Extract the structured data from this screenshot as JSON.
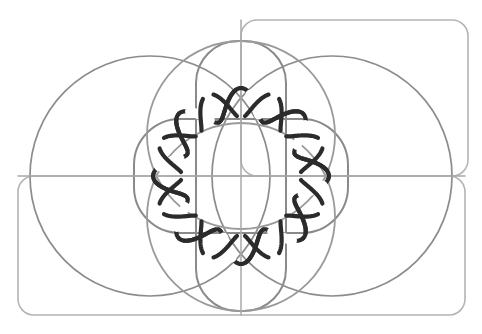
{
  "figure": {
    "canvas": {
      "width": 482,
      "height": 334,
      "background": "#ffffff"
    },
    "center": {
      "x": 241,
      "y": 176
    },
    "colors": {
      "rect_gray": "#b4b4b4",
      "circle_gray": "#8c8c8c",
      "lobe_gray": "#8a8a8a",
      "lens_gray": "#9a9a9a",
      "axis_gray": "#a8a8a8",
      "knot_dark": "#2b2b2b"
    },
    "stroke_widths": {
      "rect": 1.6,
      "circle": 1.7,
      "lobe": 2.0,
      "lens": 1.8,
      "axis": 1.5,
      "knot": 4.2
    },
    "layers": [
      {
        "name": "rounded-rect-top-right",
        "type": "rounded-rect",
        "x": 241,
        "y": 20,
        "width": 227,
        "height": 156,
        "radius": 16,
        "color_key": "rect_gray",
        "width_key": "rect"
      },
      {
        "name": "rounded-rect-bottom-left",
        "type": "rounded-rect",
        "x": 18,
        "y": 176,
        "width": 447,
        "height": 139,
        "radius": 16,
        "color_key": "rect_gray",
        "width_key": "rect"
      },
      {
        "name": "large-circle-left",
        "type": "circle",
        "cx": 150,
        "cy": 176,
        "r": 120,
        "color_key": "circle_gray",
        "width_key": "circle"
      },
      {
        "name": "large-circle-right",
        "type": "circle",
        "cx": 332,
        "cy": 176,
        "r": 120,
        "color_key": "circle_gray",
        "width_key": "circle"
      },
      {
        "name": "lobe-rect-horizontal",
        "type": "rounded-rect",
        "x": 134,
        "y": 119,
        "width": 214,
        "height": 114,
        "radius": 46,
        "color_key": "lobe_gray",
        "width_key": "lobe"
      },
      {
        "name": "lobe-rect-vertical",
        "type": "rounded-rect",
        "x": 196,
        "y": 41,
        "width": 90,
        "height": 270,
        "radius": 42,
        "color_key": "lobe_gray",
        "width_key": "lobe"
      },
      {
        "name": "lens-circle-upper",
        "type": "circle",
        "cx": 241,
        "cy": 217,
        "r": 94,
        "color_key": "lens_gray",
        "width_key": "lens"
      },
      {
        "name": "lens-circle-lower",
        "type": "circle",
        "cx": 241,
        "cy": 135,
        "r": 94,
        "color_key": "lens_gray",
        "width_key": "lens"
      },
      {
        "name": "axis-line-horizontal",
        "type": "line",
        "x1": 18,
        "y1": 176,
        "x2": 465,
        "y2": 176,
        "color_key": "axis_gray",
        "width_key": "axis"
      },
      {
        "name": "axis-line-vertical",
        "type": "line",
        "x1": 241,
        "y1": 20,
        "x2": 241,
        "y2": 315,
        "color_key": "axis_gray",
        "width_key": "axis"
      }
    ],
    "knot": {
      "name": "braided-knot-ring",
      "type": "wavy-ring",
      "cx": 241,
      "cy": 176,
      "lobes": 8,
      "radius_outer": 88,
      "radius_inner": 58,
      "phase_deg": 0,
      "color_key": "knot_dark",
      "width_key": "knot",
      "description": "Eight-lobed interwoven ring with over-under crossings"
    },
    "labels": {
      "figure_caption": "",
      "note": ""
    }
  }
}
